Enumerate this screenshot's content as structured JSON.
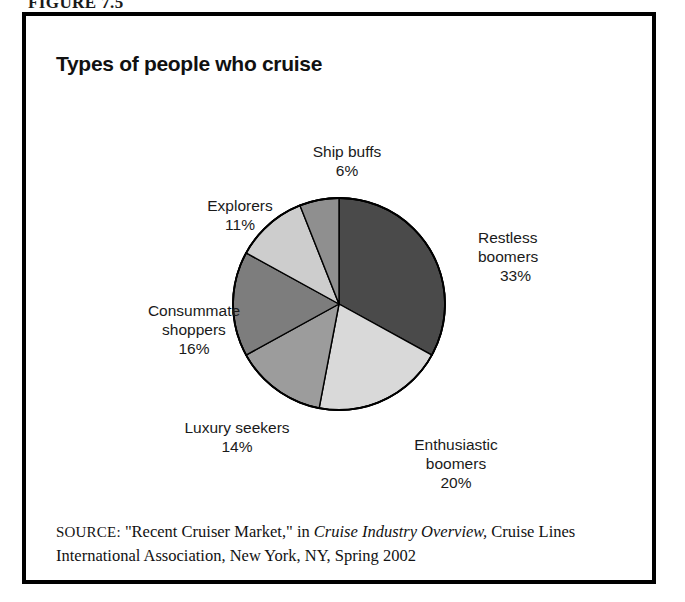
{
  "figure": {
    "caption": "FIGURE 7.5",
    "title": "Types of people who cruise"
  },
  "chart_data": {
    "type": "pie",
    "title": "Types of people who cruise",
    "xlabel": "",
    "ylabel": "",
    "start_angle_deg": 0,
    "direction": "clockwise",
    "legend": "none",
    "grid": false,
    "categories": [
      "Restless boomers",
      "Enthusiastic boomers",
      "Luxury seekers",
      "Consummate shoppers",
      "Explorers",
      "Ship buffs"
    ],
    "values": [
      33,
      20,
      14,
      16,
      11,
      6
    ],
    "unit": "%",
    "slices": [
      {
        "label": "Restless boomers",
        "label_line1": "Restless",
        "label_line2": "boomers",
        "value": 33,
        "value_text": "33%",
        "color": "#4a4a4a"
      },
      {
        "label": "Enthusiastic boomers",
        "label_line1": "Enthusiastic",
        "label_line2": "boomers",
        "value": 20,
        "value_text": "20%",
        "color": "#d9d9d9"
      },
      {
        "label": "Luxury seekers",
        "label_line1": "Luxury seekers",
        "label_line2": "",
        "value": 14,
        "value_text": "14%",
        "color": "#9c9c9c"
      },
      {
        "label": "Consummate shoppers",
        "label_line1": "Consummate",
        "label_line2": "shoppers",
        "value": 16,
        "value_text": "16%",
        "color": "#7d7d7d"
      },
      {
        "label": "Explorers",
        "label_line1": "Explorers",
        "label_line2": "",
        "value": 11,
        "value_text": "11%",
        "color": "#cdcdcd"
      },
      {
        "label": "Ship buffs",
        "label_line1": "Ship buffs",
        "label_line2": "",
        "value": 6,
        "value_text": "6%",
        "color": "#8f8f8f"
      }
    ]
  },
  "source": {
    "label": "SOURCE:",
    "text_part1": " \"Recent Cruiser Market,\" in ",
    "italic_title": "Cruise Industry Overview,",
    "text_part2": " Cruise Lines International Association, New York, NY, Spring 2002"
  }
}
